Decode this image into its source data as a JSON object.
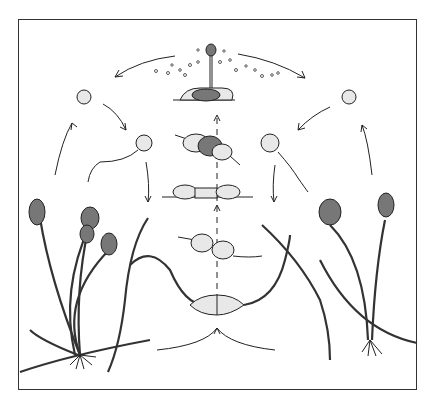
{
  "figure": {
    "type": "scientific-illustration",
    "text_labels": [],
    "colors": {
      "line": "#222222",
      "background": "#ffffff"
    },
    "stages": [
      "sporangiophores-left",
      "sporangiophores-right",
      "hyphae-meeting",
      "gametangia-contact",
      "progametangia",
      "fused-gametangia",
      "developing-zygospore",
      "mature-zygospore-germinating",
      "spore-release",
      "spore-left",
      "spore-right",
      "germinating-spore-left",
      "germinating-spore-right"
    ]
  }
}
